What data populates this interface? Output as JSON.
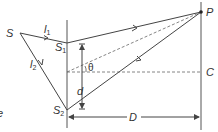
{
  "diagram": {
    "labels": {
      "source": "S",
      "slit1": "S",
      "slit1_sub": "1",
      "slit2": "S",
      "slit2_sub": "2",
      "path1": "l",
      "path1_sub": "1",
      "path2": "l",
      "path2_sub": "2",
      "point": "P",
      "center": "C",
      "separation": "d",
      "distance": "D",
      "angle": "θ",
      "cut_text": "e"
    },
    "colors": {
      "line": "#444444",
      "dashed": "#666666",
      "text": "#333333"
    }
  }
}
